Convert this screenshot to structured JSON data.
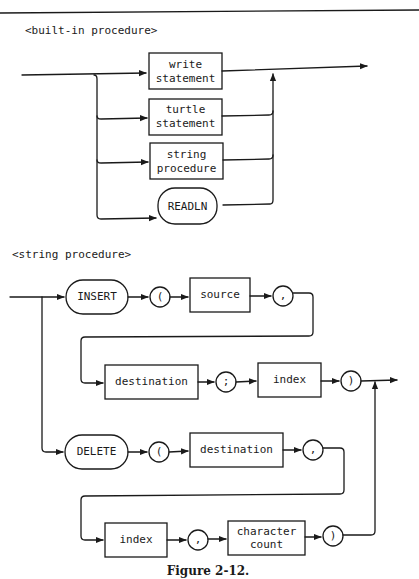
{
  "figure": {
    "caption": "Figure 2-12."
  },
  "diagrams": [
    {
      "title": "<built-in procedure>",
      "alternatives": [
        {
          "kind": "nonterminal",
          "lines": [
            "write",
            "statement"
          ]
        },
        {
          "kind": "nonterminal",
          "lines": [
            "turtle",
            "statement"
          ]
        },
        {
          "kind": "nonterminal",
          "lines": [
            "string",
            "procedure"
          ]
        },
        {
          "kind": "terminal",
          "lines": [
            "READLN"
          ]
        }
      ]
    },
    {
      "title": "<string procedure>",
      "insert_path": {
        "row1": [
          {
            "kind": "terminal",
            "label": "INSERT"
          },
          {
            "kind": "symbol",
            "label": "("
          },
          {
            "kind": "nonterminal",
            "label": "source"
          },
          {
            "kind": "symbol",
            "label": ","
          }
        ],
        "row2": [
          {
            "kind": "nonterminal",
            "label": "destination"
          },
          {
            "kind": "symbol",
            "label": ";"
          },
          {
            "kind": "nonterminal",
            "label": "index"
          },
          {
            "kind": "symbol",
            "label": ")"
          }
        ]
      },
      "delete_path": {
        "row1": [
          {
            "kind": "terminal",
            "label": "DELETE"
          },
          {
            "kind": "symbol",
            "label": "("
          },
          {
            "kind": "nonterminal",
            "label": "destination"
          },
          {
            "kind": "symbol",
            "label": ","
          }
        ],
        "row2": [
          {
            "kind": "nonterminal",
            "label": "index"
          },
          {
            "kind": "symbol",
            "label": ","
          },
          {
            "kind": "nonterminal",
            "lines": [
              "character",
              "count"
            ]
          },
          {
            "kind": "symbol",
            "label": ")"
          }
        ]
      }
    }
  ]
}
